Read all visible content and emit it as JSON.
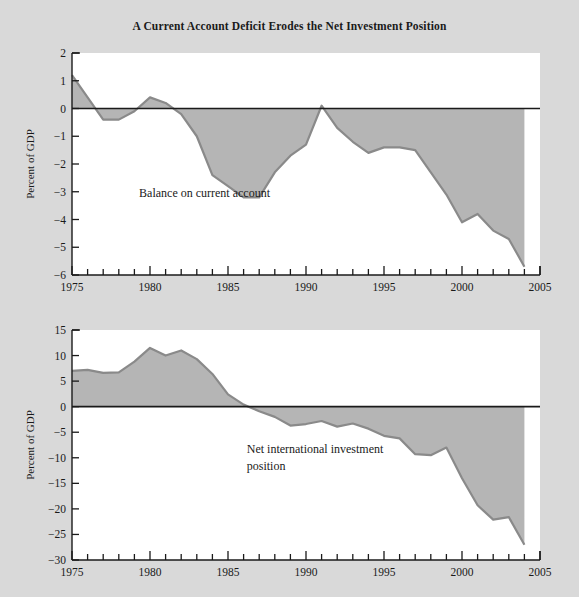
{
  "figure": {
    "title": "A Current Account Deficit Erodes the Net Investment Position",
    "background_color": "#d9d9d9",
    "plot_background_color": "#ffffff",
    "area_fill_color": "#b5b5b5",
    "line_color": "#8a8a8a",
    "axis_color": "#1a1a1a"
  },
  "chart_data": [
    {
      "type": "area",
      "title": "Balance on current account",
      "xlabel": "",
      "ylabel": "Percent of GDP",
      "xlim": [
        1975,
        2005
      ],
      "ylim": [
        -6,
        2
      ],
      "yticks": [
        2,
        1,
        0,
        -1,
        -2,
        -3,
        -4,
        -5,
        -6
      ],
      "ytick_labels": [
        "2",
        "1",
        "0",
        "−1",
        "−2",
        "−3",
        "−4",
        "−5",
        "−6"
      ],
      "xticks": [
        1975,
        1980,
        1985,
        1990,
        1995,
        2000,
        2005
      ],
      "xtick_labels": [
        "1975",
        "1980",
        "1985",
        "1990",
        "1995",
        "2000",
        "2005"
      ],
      "xtick_minor_step": 1,
      "grid": false,
      "zero_line": 0,
      "annotations": [
        {
          "text": "Balance on current account",
          "x": 1979.3,
          "y": -3.05
        }
      ],
      "x": [
        1975,
        1976,
        1977,
        1978,
        1979,
        1980,
        1981,
        1982,
        1983,
        1984,
        1985,
        1986,
        1987,
        1988,
        1989,
        1990,
        1991,
        1992,
        1993,
        1994,
        1995,
        1996,
        1997,
        1998,
        1999,
        2000,
        2001,
        2002,
        2003,
        2004
      ],
      "values": [
        1.2,
        0.4,
        -0.4,
        -0.4,
        -0.1,
        0.4,
        0.2,
        -0.2,
        -1.0,
        -2.4,
        -2.8,
        -3.2,
        -3.2,
        -2.3,
        -1.7,
        -1.3,
        0.1,
        -0.7,
        -1.2,
        -1.6,
        -1.4,
        -1.4,
        -1.5,
        -2.3,
        -3.1,
        -4.1,
        -3.8,
        -4.4,
        -4.7,
        -5.7
      ]
    },
    {
      "type": "area",
      "title": "Net international investment position",
      "xlabel": "",
      "ylabel": "Percent of GDP",
      "xlim": [
        1975,
        2005
      ],
      "ylim": [
        -30,
        15
      ],
      "yticks": [
        15,
        10,
        5,
        0,
        -5,
        -10,
        -15,
        -20,
        -25,
        -30
      ],
      "ytick_labels": [
        "15",
        "10",
        "5",
        "0",
        "−5",
        "−10",
        "−15",
        "−20",
        "−25",
        "−30"
      ],
      "xticks": [
        1975,
        1980,
        1985,
        1990,
        1995,
        2000,
        2005
      ],
      "xtick_labels": [
        "1975",
        "1980",
        "1985",
        "1990",
        "1995",
        "2000",
        "2005"
      ],
      "xtick_minor_step": 1,
      "grid": false,
      "zero_line": 0,
      "annotations": [
        {
          "text": "Net international investment",
          "x": 1986.2,
          "y": -8.2
        },
        {
          "text": "position",
          "x": 1986.2,
          "y": -11.6
        }
      ],
      "x": [
        1975,
        1976,
        1977,
        1978,
        1979,
        1980,
        1981,
        1982,
        1983,
        1984,
        1985,
        1986,
        1987,
        1988,
        1989,
        1990,
        1991,
        1992,
        1993,
        1994,
        1995,
        1996,
        1997,
        1998,
        1999,
        2000,
        2001,
        2002,
        2003,
        2004
      ],
      "values": [
        7.0,
        7.2,
        6.6,
        6.7,
        8.8,
        11.5,
        10.0,
        11.0,
        9.3,
        6.4,
        2.4,
        0.4,
        -0.9,
        -2.0,
        -3.7,
        -3.4,
        -2.8,
        -3.9,
        -3.3,
        -4.3,
        -5.7,
        -6.2,
        -9.3,
        -9.5,
        -8.0,
        -14.0,
        -19.3,
        -22.1,
        -21.6,
        -27.0
      ]
    }
  ]
}
